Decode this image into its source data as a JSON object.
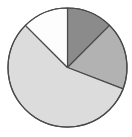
{
  "figure": {
    "width": 132,
    "height": 137,
    "background_color": "#ffffff"
  },
  "chart_data": {
    "type": "pie",
    "title": "",
    "subtitle": "",
    "xlabel": "",
    "ylabel": "",
    "grid": false,
    "legend": "none",
    "labels": [
      "Slice 1",
      "Slice 2",
      "Slice 3",
      "Slice 4"
    ],
    "values": [
      12.5,
      18.3,
      56.7,
      12.5
    ],
    "start_angle_deg": 0,
    "direction": "clockwise",
    "slice_angles_deg": [
      45,
      66,
      204,
      45
    ],
    "slice_boundaries_deg": [
      0,
      45,
      111,
      315,
      360
    ],
    "colors": [
      "#8b8b8b",
      "#b2b2b2",
      "#dcdcdc",
      "#fdfdfd"
    ],
    "edge_color": "#4a4a4a",
    "edge_width": 1.2,
    "geometry": {
      "center_x": 67.5,
      "center_y": 67.5,
      "radius": 59.5
    },
    "slices": [
      {
        "label": "Slice 1",
        "value": 12.5,
        "color": "#8b8b8b",
        "start_deg": 0,
        "end_deg": 45
      },
      {
        "label": "Slice 2",
        "value": 18.3,
        "color": "#b2b2b2",
        "start_deg": 45,
        "end_deg": 111
      },
      {
        "label": "Slice 3",
        "value": 56.7,
        "color": "#dcdcdc",
        "start_deg": 111,
        "end_deg": 315
      },
      {
        "label": "Slice 4",
        "value": 12.5,
        "color": "#fdfdfd",
        "start_deg": 315,
        "end_deg": 360
      }
    ]
  }
}
